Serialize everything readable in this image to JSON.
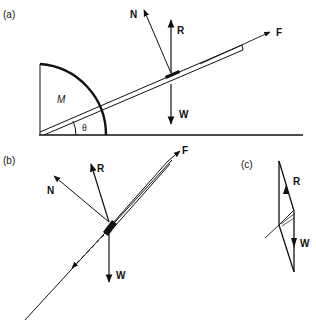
{
  "panels": {
    "a": {
      "label": "(a)",
      "mass_label": "M",
      "angle_label": "θ",
      "forces": {
        "N": "N",
        "R": "R",
        "F": "F",
        "W": "W"
      }
    },
    "b": {
      "label": "(b)",
      "forces": {
        "N": "N",
        "R": "R",
        "F": "F",
        "W": "W"
      }
    },
    "c": {
      "label": "(c)",
      "forces": {
        "R": "R",
        "W": "W"
      }
    }
  },
  "colors": {
    "ink": "#111111",
    "background": "#ffffff"
  }
}
